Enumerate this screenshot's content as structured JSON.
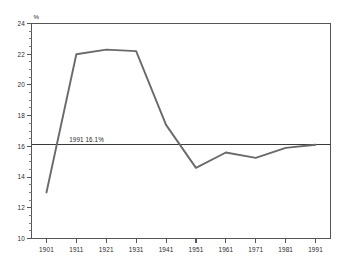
{
  "chart_data": {
    "type": "line",
    "title": "",
    "subtitle": "",
    "xlabel": "",
    "ylabel": "",
    "unit_label": "%",
    "x": [
      1901,
      1911,
      1921,
      1931,
      1941,
      1951,
      1961,
      1971,
      1981,
      1991
    ],
    "values": [
      13.0,
      22.0,
      22.3,
      22.2,
      17.4,
      14.6,
      15.6,
      15.25,
      15.9,
      16.1
    ],
    "series": [
      {
        "name": "percent",
        "values": [
          13.0,
          22.0,
          22.3,
          22.2,
          17.4,
          14.6,
          15.6,
          15.25,
          15.9,
          16.1
        ],
        "color": "#6a6a6a"
      }
    ],
    "xlim": [
      1896,
      1996
    ],
    "ylim": [
      10,
      24
    ],
    "y_ticks": [
      10,
      12,
      14,
      16,
      18,
      20,
      22,
      24
    ],
    "y_tick_labels": [
      "10",
      "12",
      "14",
      "16",
      "18",
      "20",
      "22",
      "24"
    ],
    "y_minor_step": 0.5,
    "x_ticks": [
      1901,
      1911,
      1921,
      1931,
      1941,
      1951,
      1961,
      1971,
      1981,
      1991
    ],
    "x_tick_labels": [
      "1901",
      "1911",
      "1921",
      "1931",
      "1941",
      "1951",
      "1961",
      "1971",
      "1981",
      "1991"
    ],
    "grid": false,
    "legend": false,
    "legend_position": "none",
    "reference_line": {
      "value": 16.1,
      "label": "1991  16.1%",
      "color": "#3a3a3a"
    },
    "annotations": [
      {
        "text": "1991  16.1%",
        "x": 1921,
        "y": 16.1
      }
    ],
    "axis_color": "#555555",
    "background": "#ffffff"
  }
}
